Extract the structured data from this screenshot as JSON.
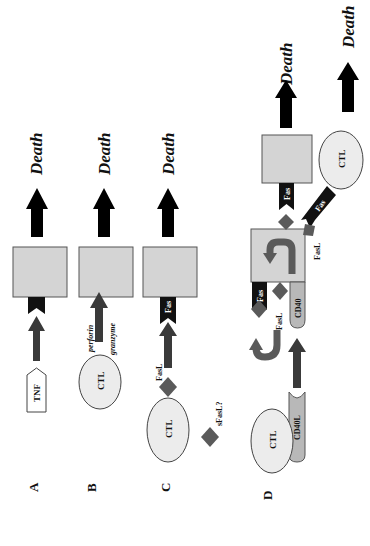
{
  "figure": {
    "orientation": "rotated-90-ccw",
    "colors": {
      "cell_fill": "#d4d4d4",
      "ctl_fill": "#ececec",
      "receptor": "#111111",
      "arrow_signal": "#3a3a3a",
      "arrow_death": "#000000",
      "ligand": "#5a5a5a",
      "cd40_fill": "#b8b8b8"
    },
    "panels": [
      {
        "id": "A",
        "label": "A",
        "ligand": "TNF",
        "outcome": "Death"
      },
      {
        "id": "B",
        "label": "B",
        "effector": "CTL",
        "mediators": [
          "perforin",
          "granzyme"
        ],
        "outcome": "Death"
      },
      {
        "id": "C",
        "label": "C",
        "effector": "CTL",
        "ligand": "FasL",
        "receptor": "Fas",
        "soluble": "sFasL?",
        "outcome": "Death"
      },
      {
        "id": "D",
        "label": "D",
        "effector": "CTL",
        "effector_ligand": "CD40L",
        "target_receptor": "CD40",
        "upregulated": [
          "FasL",
          "Fas"
        ],
        "outcome_target": "Death",
        "outcome_ctl": "Death"
      }
    ]
  },
  "labels": {
    "panel_a": "A",
    "panel_b": "B",
    "panel_c": "C",
    "panel_d": "D",
    "death": "Death",
    "tnf": "TNF",
    "ctl": "CTL",
    "perforin": "perforin",
    "granzyme": "granzyme",
    "fasl": "FasL",
    "fas": "Fas",
    "sfasl": "sFasL?",
    "cd40": "CD40",
    "cd40l": "CD40L"
  }
}
